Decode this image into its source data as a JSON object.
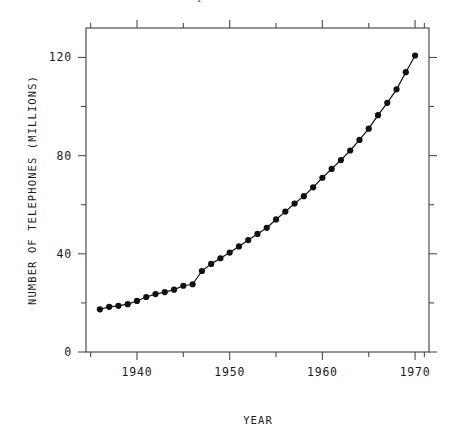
{
  "figure": {
    "clipped_header_text": "dicted the total number of telephones in the United States",
    "background_color": "#ffffff",
    "line_color": "#111111",
    "marker_color": "#111111",
    "axis_color": "#4d4d4d"
  },
  "chart_data": {
    "type": "line",
    "title": "",
    "subtitle": "",
    "xlabel": "YEAR",
    "ylabel": "NUMBER OF TELEPHONES (MILLIONS)",
    "xlim": [
      1934.5,
      1971.5
    ],
    "ylim": [
      0,
      132
    ],
    "x_ticks_labeled": [
      1940,
      1950,
      1960,
      1970
    ],
    "x_ticks_labels": [
      "1940",
      "1950",
      "1960",
      "1970"
    ],
    "x_ticks_minor": [
      1935,
      1945,
      1955,
      1965,
      1971
    ],
    "y_ticks_labeled": [
      0,
      40,
      80,
      120
    ],
    "y_ticks_labels": [
      "0",
      "40",
      "80",
      "120"
    ],
    "y_ticks_minor": [
      20,
      60,
      100
    ],
    "grid": false,
    "legend": null,
    "marker": "filled-circle",
    "series": [
      {
        "name": "Telephones in the United States",
        "x": [
          1936,
          1937,
          1938,
          1939,
          1940,
          1941,
          1942,
          1943,
          1944,
          1945,
          1946,
          1947,
          1948,
          1949,
          1950,
          1951,
          1952,
          1953,
          1954,
          1955,
          1956,
          1957,
          1958,
          1959,
          1960,
          1961,
          1962,
          1963,
          1964,
          1965,
          1966,
          1967,
          1968,
          1969,
          1970
        ],
        "values": [
          17.4,
          18.4,
          18.8,
          19.5,
          20.8,
          22.4,
          23.6,
          24.4,
          25.4,
          27.0,
          27.6,
          33.0,
          35.9,
          38.2,
          40.5,
          43.0,
          45.6,
          48.1,
          50.6,
          54.0,
          57.2,
          60.5,
          63.5,
          67.1,
          71.0,
          74.6,
          78.2,
          82.1,
          86.4,
          91.0,
          96.5,
          101.5,
          107.0,
          114.0,
          120.8
        ]
      }
    ]
  }
}
